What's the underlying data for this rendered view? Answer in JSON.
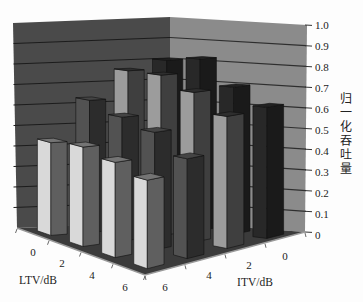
{
  "chart_data": {
    "type": "bar",
    "projection": "3d",
    "title": "",
    "xlabel": "LTV/dB",
    "depth_label": "ITV/dB",
    "ylabel": "归一化吞吐量",
    "ylim": [
      0,
      1.0
    ],
    "yticks": [
      "0",
      "0.1",
      "0.2",
      "0.3",
      "0.4",
      "0.5",
      "0.6",
      "0.7",
      "0.8",
      "0.9",
      "1.0"
    ],
    "categories": [
      "0",
      "2",
      "4",
      "6"
    ],
    "depth_categories": [
      "6",
      "4",
      "2",
      "0"
    ],
    "grid": true,
    "legend": null,
    "series": [
      {
        "name": "ITV=6 dB",
        "itv": "6",
        "values": [
          0.44,
          0.46,
          0.43,
          0.39
        ],
        "color": {
          "front": "#d9d9d9",
          "side": "#5f5f5f",
          "top": "#747474"
        }
      },
      {
        "name": "ITV=4 dB",
        "itv": "4",
        "values": [
          0.63,
          0.58,
          0.54,
          0.45
        ],
        "color": {
          "front": "#525252",
          "side": "#2c2c2c",
          "top": "#444444"
        }
      },
      {
        "name": "ITV=2 dB",
        "itv": "2",
        "values": [
          0.76,
          0.76,
          0.7,
          0.61
        ],
        "color": {
          "front": "#9c9c9c",
          "side": "#3f3f3f",
          "top": "#2e2e2e"
        }
      },
      {
        "name": "ITV=0 dB",
        "itv": "0",
        "values": [
          0.8,
          0.82,
          0.7,
          0.62
        ],
        "color": {
          "front": "#282828",
          "side": "#1a1a1a",
          "top": "#222222"
        }
      }
    ]
  },
  "colors": {
    "left_wall": "#4a4a4a",
    "right_wall": "#8b8b8b",
    "floor": "#3b3b3b",
    "gridline": "#1c1c1c"
  }
}
